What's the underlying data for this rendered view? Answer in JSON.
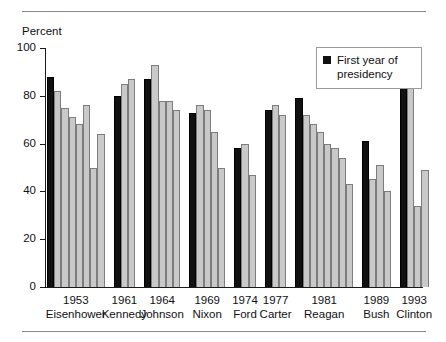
{
  "chart_data": {
    "type": "bar",
    "title": "",
    "xlabel": "",
    "ylabel": "Percent",
    "ylim": [
      0,
      100
    ],
    "yticks": [
      0,
      20,
      40,
      60,
      80,
      100
    ],
    "grid": false,
    "legend_position": "top-right",
    "legend": [
      {
        "label": "First year of presidency",
        "color": "#111111"
      }
    ],
    "series_colors": {
      "first_year": "#111111",
      "later_years": "#c9c9c9"
    },
    "categories": [
      {
        "year": "1953",
        "name": "Eisenhower"
      },
      {
        "year": "1961",
        "name": "Kennedy"
      },
      {
        "year": "1964",
        "name": "Johnson"
      },
      {
        "year": "1969",
        "name": "Nixon"
      },
      {
        "year": "1974",
        "name": "Ford"
      },
      {
        "year": "1977",
        "name": "Carter"
      },
      {
        "year": "1981",
        "name": "Reagan"
      },
      {
        "year": "1989",
        "name": "Bush"
      },
      {
        "year": "1993",
        "name": "Clinton"
      }
    ],
    "groups": [
      {
        "year": "1953",
        "name": "Eisenhower",
        "values": [
          88,
          82,
          75,
          71,
          68,
          76,
          50,
          64
        ]
      },
      {
        "year": "1961",
        "name": "Kennedy",
        "values": [
          80,
          85,
          87
        ]
      },
      {
        "year": "1964",
        "name": "Johnson",
        "values": [
          87,
          93,
          78,
          78,
          74
        ]
      },
      {
        "year": "1969",
        "name": "Nixon",
        "values": [
          73,
          76,
          74,
          65,
          50
        ]
      },
      {
        "year": "1974",
        "name": "Ford",
        "values": [
          58,
          60,
          47
        ]
      },
      {
        "year": "1977",
        "name": "Carter",
        "values": [
          74,
          76,
          72
        ]
      },
      {
        "year": "1981",
        "name": "Reagan",
        "values": [
          79,
          72,
          68,
          65,
          60,
          58,
          54,
          43
        ]
      },
      {
        "year": "1989",
        "name": "Bush",
        "values": [
          61,
          45,
          51,
          40
        ]
      },
      {
        "year": "1993",
        "name": "Clinton",
        "values": [
          85,
          85,
          34,
          49
        ]
      }
    ]
  },
  "axis": {
    "y_title": "Percent",
    "y_tick_labels": [
      "100",
      "80",
      "60",
      "40",
      "20",
      "0"
    ]
  },
  "legend": {
    "line1": "First year of",
    "line2": "presidency",
    "swatch": "black-square-icon"
  }
}
